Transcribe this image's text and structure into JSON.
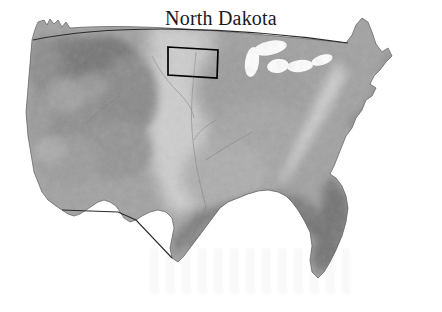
{
  "figure": {
    "kind": "locator-map",
    "title": "North Dakota",
    "subject_state": "North Dakota",
    "region_depicted": "Contiguous United States",
    "style": "grayscale shaded relief",
    "background_color": "#ffffff",
    "outline_color": "#000000",
    "border_color": "#2b2b2b"
  },
  "map": {
    "projection_note": "Curved northern border (49th parallel) and straight diagonal southwestern border",
    "elevation_legend": {
      "highest_label": "dark gray uplands",
      "mid_label": "medium gray interior",
      "plains_label": "light gray Great Plains band",
      "lowest_label": "dark gray coastal lowlands"
    },
    "shading_colors": {
      "darkest": "#6f6f6f",
      "dark": "#828282",
      "mid": "#9a9a9a",
      "light": "#b8b8b8",
      "lightest": "#d6d6d6"
    },
    "features": [
      {
        "name": "Cascade Range",
        "tone": "dark"
      },
      {
        "name": "Rocky Mountains",
        "tone": "dark"
      },
      {
        "name": "Great Basin",
        "tone": "mid"
      },
      {
        "name": "Great Plains",
        "tone": "light"
      },
      {
        "name": "Appalachian Mountains",
        "tone": "light"
      },
      {
        "name": "Gulf Coastal Plain",
        "tone": "darkest"
      },
      {
        "name": "Atlantic Coastal Plain",
        "tone": "darkest"
      },
      {
        "name": "Florida Peninsula",
        "tone": "darkest"
      },
      {
        "name": "Great Lakes",
        "tone": "background"
      }
    ],
    "highlight": {
      "label": "North Dakota",
      "shape": "quadrilateral outline",
      "stroke_width_px": 1.6,
      "stroke_color": "#000000",
      "fill": "none"
    }
  }
}
